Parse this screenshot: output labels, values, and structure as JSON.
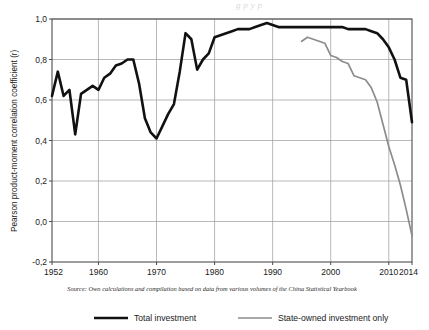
{
  "figure": {
    "background_color": "#ffffff",
    "plot_area": {
      "frame_color": "#4d4d4d",
      "grid_color": "#9a9a9a",
      "grid_on": true
    },
    "faint_header_bleed": "g p y p"
  },
  "axes": {
    "y_axis_title": "Pearson product-moment correlation coefficient (r)",
    "y_tick_labels": [
      "1,0",
      "0,8",
      "0,6",
      "0,4",
      "0,2",
      "0,0",
      "-0,2"
    ],
    "y_tick_values": [
      1.0,
      0.8,
      0.6,
      0.4,
      0.2,
      0.0,
      -0.2
    ],
    "x_tick_labels": [
      "1952",
      "1960",
      "1970",
      "1980",
      "1990",
      "2000",
      "2010",
      "2014"
    ],
    "x_tick_values": [
      1952,
      1960,
      1970,
      1980,
      1990,
      2000,
      2010,
      2014
    ]
  },
  "source": {
    "text": "Source: Own calculations and compilation based on data from various volumes of the China Statistical Yearbook"
  },
  "legend": {
    "position": "bottom",
    "items": [
      {
        "label": "Total investment",
        "color": "#111111",
        "width": 2.6
      },
      {
        "label": "State-owned investment only",
        "color": "#8c8c8c",
        "width": 1.7
      }
    ]
  },
  "chart_data": {
    "type": "line",
    "title": "",
    "subtitle": "",
    "xlabel": "",
    "ylabel": "Pearson product-moment correlation coefficient (r)",
    "xlim": [
      1952,
      2014
    ],
    "ylim": [
      -0.2,
      1.0
    ],
    "grid": true,
    "legend_position": "bottom",
    "annotations": [
      "Source: Own calculations and compilation based on data from various volumes of the China Statistical Yearbook"
    ],
    "series": [
      {
        "name": "Total investment",
        "color": "#111111",
        "x": [
          1952,
          1953,
          1954,
          1955,
          1956,
          1957,
          1958,
          1959,
          1960,
          1961,
          1962,
          1963,
          1964,
          1965,
          1966,
          1967,
          1968,
          1969,
          1970,
          1971,
          1972,
          1973,
          1974,
          1975,
          1976,
          1977,
          1978,
          1979,
          1980,
          1981,
          1982,
          1983,
          1984,
          1985,
          1986,
          1987,
          1988,
          1989,
          1990,
          1991,
          1992,
          1993,
          1994,
          1995,
          1996,
          1997,
          1998,
          1999,
          2000,
          2001,
          2002,
          2003,
          2004,
          2005,
          2006,
          2007,
          2008,
          2009,
          2010,
          2011,
          2012,
          2013,
          2014
        ],
        "values": [
          0.62,
          0.74,
          0.62,
          0.65,
          0.43,
          0.63,
          0.65,
          0.67,
          0.65,
          0.71,
          0.73,
          0.77,
          0.78,
          0.8,
          0.8,
          0.68,
          0.51,
          0.44,
          0.41,
          0.47,
          0.53,
          0.58,
          0.74,
          0.93,
          0.9,
          0.75,
          0.8,
          0.83,
          0.91,
          0.92,
          0.93,
          0.94,
          0.95,
          0.95,
          0.95,
          0.96,
          0.97,
          0.98,
          0.97,
          0.96,
          0.96,
          0.96,
          0.96,
          0.96,
          0.96,
          0.96,
          0.96,
          0.96,
          0.96,
          0.96,
          0.96,
          0.95,
          0.95,
          0.95,
          0.95,
          0.94,
          0.93,
          0.9,
          0.86,
          0.8,
          0.71,
          0.7,
          0.49
        ]
      },
      {
        "name": "State-owned investment only",
        "color": "#8c8c8c",
        "x": [
          1995,
          1996,
          1997,
          1998,
          1999,
          2000,
          2001,
          2002,
          2003,
          2004,
          2005,
          2006,
          2007,
          2008,
          2009,
          2010,
          2011,
          2012,
          2013,
          2014
        ],
        "values": [
          0.89,
          0.91,
          0.9,
          0.89,
          0.88,
          0.82,
          0.81,
          0.79,
          0.78,
          0.72,
          0.71,
          0.7,
          0.66,
          0.59,
          0.48,
          0.37,
          0.28,
          0.18,
          0.06,
          -0.07
        ]
      }
    ]
  }
}
